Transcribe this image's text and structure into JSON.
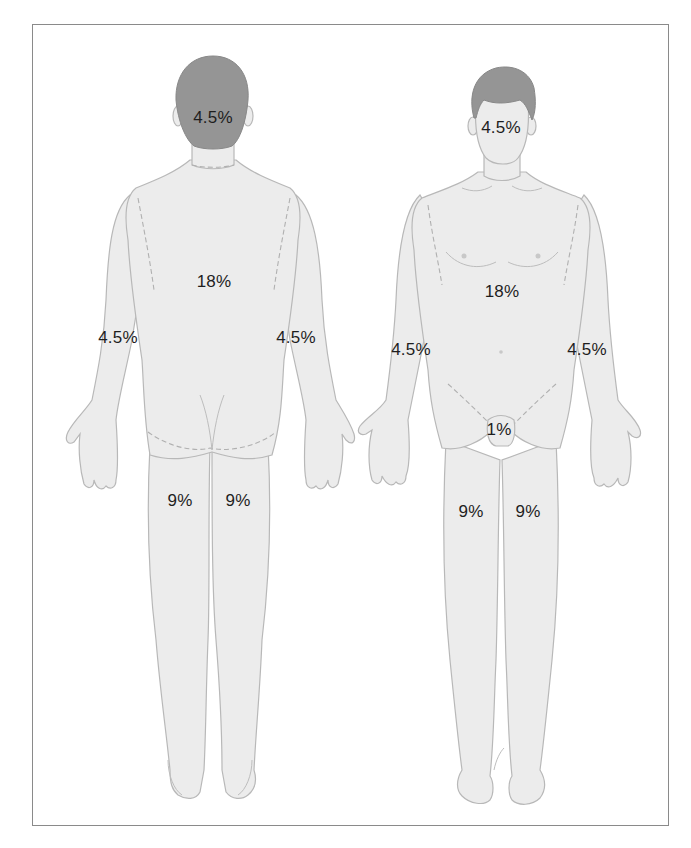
{
  "diagram": {
    "colors": {
      "skin": "#ececec",
      "outline": "#b5b5b5",
      "hair": "#959595",
      "text": "#1e1e1e",
      "frame": "#8a8a8a"
    },
    "back_view": {
      "name": "Posterior view",
      "labels": {
        "head": "4.5%",
        "trunk": "18%",
        "right_arm": "4.5%",
        "left_arm": "4.5%",
        "right_leg": "9%",
        "left_leg": "9%"
      }
    },
    "front_view": {
      "name": "Anterior view",
      "labels": {
        "head": "4.5%",
        "trunk": "18%",
        "right_arm": "4.5%",
        "left_arm": "4.5%",
        "groin": "1%",
        "right_leg": "9%",
        "left_leg": "9%"
      }
    }
  }
}
